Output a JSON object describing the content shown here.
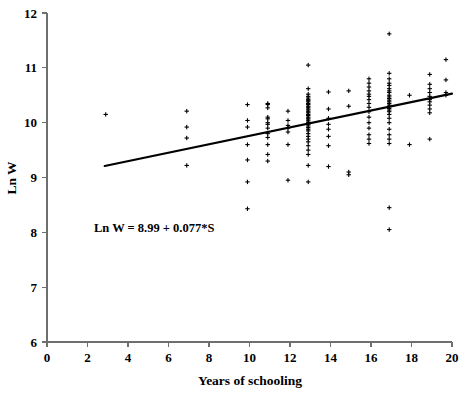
{
  "chart_data": {
    "type": "scatter",
    "title": "",
    "xlabel": "Years of schooling",
    "ylabel": "Ln W",
    "xlim": [
      0,
      20
    ],
    "ylim": [
      6,
      12
    ],
    "xticks": [
      0,
      2,
      4,
      6,
      8,
      10,
      12,
      14,
      16,
      18,
      20
    ],
    "yticks": [
      6,
      7,
      8,
      9,
      10,
      11,
      12
    ],
    "grid": false,
    "legend": null,
    "annotations": [
      {
        "name": "regression-equation",
        "text": "Ln W = 8.99 + 0.077*S",
        "x": 4.2,
        "y": 8.2
      }
    ],
    "fit_line": {
      "name": "regression-line",
      "equation": "Ln W = 8.99 + 0.077*S",
      "intercept": 8.99,
      "slope": 0.077,
      "x_start": 2.85,
      "x_end": 20.0,
      "y_start": 9.21,
      "y_end": 10.53
    },
    "marker": "plus",
    "series": [
      {
        "name": "observations",
        "x": [
          2.9,
          6.9,
          6.9,
          6.9,
          6.9,
          9.9,
          9.9,
          9.9,
          9.9,
          9.9,
          9.9,
          9.9,
          10.9,
          10.9,
          10.9,
          10.9,
          10.9,
          10.9,
          10.9,
          10.9,
          10.9,
          10.9,
          10.9,
          10.9,
          10.9,
          11.9,
          11.9,
          11.9,
          11.9,
          11.9,
          11.9,
          11.9,
          12.9,
          12.9,
          12.9,
          12.9,
          12.9,
          12.9,
          12.9,
          12.9,
          12.9,
          12.9,
          12.9,
          12.9,
          12.9,
          12.9,
          12.9,
          12.9,
          12.9,
          12.9,
          12.9,
          12.9,
          12.9,
          12.9,
          12.9,
          12.9,
          12.9,
          12.9,
          12.9,
          12.9,
          12.9,
          12.9,
          12.9,
          12.9,
          12.9,
          12.9,
          12.9,
          12.9,
          12.9,
          13.9,
          13.9,
          13.9,
          13.9,
          13.9,
          13.9,
          13.9,
          13.9,
          14.9,
          14.9,
          14.9,
          14.9,
          15.9,
          15.9,
          15.9,
          15.9,
          15.9,
          15.9,
          15.9,
          15.9,
          15.9,
          15.9,
          15.9,
          15.9,
          15.9,
          15.9,
          15.9,
          15.9,
          16.9,
          16.9,
          16.9,
          16.9,
          16.9,
          16.9,
          16.9,
          16.9,
          16.9,
          16.9,
          16.9,
          16.9,
          16.9,
          16.9,
          16.9,
          16.9,
          16.9,
          16.9,
          16.9,
          16.9,
          16.9,
          16.9,
          16.9,
          16.9,
          16.9,
          16.9,
          16.9,
          16.9,
          17.9,
          17.9,
          18.9,
          18.9,
          18.9,
          18.9,
          18.9,
          18.9,
          18.9,
          18.9,
          18.9,
          18.9,
          18.9,
          19.7,
          19.7,
          19.7,
          19.7
        ],
        "y": [
          10.15,
          10.21,
          9.92,
          9.72,
          9.22,
          10.33,
          10.04,
          9.92,
          9.6,
          9.32,
          8.92,
          8.43,
          10.35,
          10.33,
          10.27,
          10.1,
          10.07,
          10.0,
          9.97,
          9.9,
          9.8,
          9.73,
          9.6,
          9.42,
          9.3,
          10.21,
          10.04,
          9.95,
          9.9,
          9.83,
          9.6,
          8.95,
          11.05,
          10.62,
          10.52,
          10.48,
          10.45,
          10.42,
          10.4,
          10.38,
          10.35,
          10.33,
          10.3,
          10.28,
          10.25,
          10.23,
          10.2,
          10.18,
          10.15,
          10.13,
          10.1,
          10.08,
          10.05,
          10.03,
          10.0,
          9.97,
          9.94,
          9.91,
          9.88,
          9.85,
          9.8,
          9.75,
          9.7,
          9.65,
          9.58,
          9.5,
          9.42,
          9.22,
          8.92,
          10.56,
          10.25,
          10.08,
          9.97,
          9.88,
          9.75,
          9.58,
          9.2,
          10.58,
          10.3,
          9.1,
          9.05,
          10.8,
          10.72,
          10.65,
          10.58,
          10.52,
          10.48,
          10.42,
          10.35,
          10.28,
          10.2,
          10.1,
          10.0,
          9.9,
          9.78,
          9.7,
          9.62,
          11.62,
          10.9,
          10.8,
          10.72,
          10.68,
          10.62,
          10.58,
          10.55,
          10.5,
          10.47,
          10.44,
          10.41,
          10.38,
          10.35,
          10.32,
          10.29,
          10.26,
          10.23,
          10.2,
          10.15,
          10.08,
          10.0,
          9.88,
          9.78,
          9.7,
          9.62,
          8.45,
          8.05,
          10.5,
          9.6,
          10.88,
          10.7,
          10.62,
          10.55,
          10.48,
          10.42,
          10.38,
          10.32,
          10.25,
          10.18,
          9.7,
          11.15,
          10.78,
          10.55,
          10.5
        ]
      }
    ]
  },
  "axes": {
    "x_axis_name": "x-axis",
    "y_axis_name": "y-axis"
  }
}
